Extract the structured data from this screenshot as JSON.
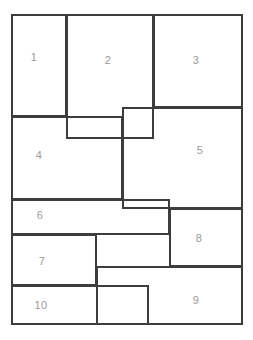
{
  "diagram": {
    "type": "rectangle-partition",
    "canvas": {
      "width": 253,
      "height": 340,
      "background": "#ffffff"
    },
    "style": {
      "line_color": "#3d3d3d",
      "line_width_px": 2,
      "label_color": "#9a9a9a",
      "label_font_size_px": 11
    },
    "bounds": {
      "left": 11,
      "top": 14,
      "right": 243,
      "bottom": 325
    },
    "regions": [
      {
        "id": "1",
        "label": "1",
        "x": 11,
        "y": 14,
        "w": 56,
        "h": 103,
        "label_x": 34,
        "label_y": 57
      },
      {
        "id": "2",
        "label": "2",
        "x": 66,
        "y": 14,
        "w": 88,
        "h": 125,
        "label_x": 108,
        "label_y": 60
      },
      {
        "id": "3",
        "label": "3",
        "x": 153,
        "y": 14,
        "w": 90,
        "h": 94,
        "label_x": 196,
        "label_y": 60
      },
      {
        "id": "4",
        "label": "4",
        "x": 11,
        "y": 116,
        "w": 112,
        "h": 84,
        "label_x": 39,
        "label_y": 155
      },
      {
        "id": "5",
        "label": "5",
        "x": 122,
        "y": 107,
        "w": 121,
        "h": 102,
        "label_x": 200,
        "label_y": 150
      },
      {
        "id": "6",
        "label": "6",
        "x": 11,
        "y": 199,
        "w": 159,
        "h": 36,
        "label_x": 40,
        "label_y": 215
      },
      {
        "id": "7",
        "label": "7",
        "x": 11,
        "y": 234,
        "w": 86,
        "h": 52,
        "label_x": 42,
        "label_y": 261
      },
      {
        "id": "8",
        "label": "8",
        "x": 169,
        "y": 208,
        "w": 74,
        "h": 59,
        "label_x": 199,
        "label_y": 238
      },
      {
        "id": "9",
        "label": "9",
        "x": 96,
        "y": 266,
        "w": 147,
        "h": 59,
        "label_x": 196,
        "label_y": 300
      },
      {
        "id": "10",
        "label": "10",
        "x": 11,
        "y": 285,
        "w": 138,
        "h": 40,
        "label_x": 41,
        "label_y": 305
      }
    ]
  }
}
